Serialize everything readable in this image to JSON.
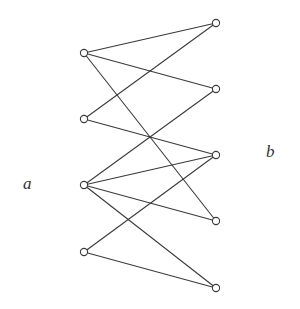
{
  "diagram": {
    "type": "bipartite-graph",
    "labels": {
      "left": "a",
      "right": "b"
    },
    "colors": {
      "stroke": "#3a3a3a",
      "node_fill": "#ffffff",
      "background": "#ffffff"
    },
    "left_nodes": [
      {
        "id": "L1",
        "x": 84,
        "y": 53
      },
      {
        "id": "L2",
        "x": 84,
        "y": 119
      },
      {
        "id": "L3",
        "x": 84,
        "y": 185
      },
      {
        "id": "L4",
        "x": 84,
        "y": 252
      }
    ],
    "right_nodes": [
      {
        "id": "R1",
        "x": 216,
        "y": 23
      },
      {
        "id": "R2",
        "x": 216,
        "y": 89
      },
      {
        "id": "R3",
        "x": 216,
        "y": 155
      },
      {
        "id": "R4",
        "x": 216,
        "y": 221
      },
      {
        "id": "R5",
        "x": 216,
        "y": 288
      }
    ],
    "edges": [
      [
        "L1",
        "R1"
      ],
      [
        "L1",
        "R2"
      ],
      [
        "L1",
        "R4"
      ],
      [
        "L2",
        "R1"
      ],
      [
        "L2",
        "R3"
      ],
      [
        "L3",
        "R2"
      ],
      [
        "L3",
        "R3"
      ],
      [
        "L3",
        "R4"
      ],
      [
        "L3",
        "R5"
      ],
      [
        "L4",
        "R3"
      ],
      [
        "L4",
        "R5"
      ]
    ]
  }
}
